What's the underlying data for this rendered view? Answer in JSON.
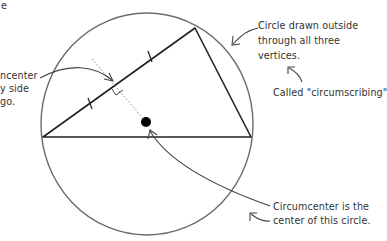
{
  "diagram": {
    "colors": {
      "background": "#ffffff",
      "circle_stroke": "#6b6b6b",
      "triangle_stroke": "#222222",
      "bisector_stroke": "#8a8a8a",
      "annotation_text": "#333333",
      "annotation_arrow": "#444444",
      "dot": "#000000"
    },
    "circle": {
      "cx": 147,
      "cy": 124,
      "rx": 106,
      "ry": 111
    },
    "triangle": {
      "vertices": [
        {
          "name": "left",
          "x": 43,
          "y": 137
        },
        {
          "name": "top",
          "x": 195,
          "y": 28
        },
        {
          "name": "right",
          "x": 251,
          "y": 137
        }
      ]
    },
    "circumcenter": {
      "x": 146,
      "y": 122,
      "r": 5
    },
    "perpendicular_bisector": {
      "from": {
        "x": 92,
        "y": 60
      },
      "to": {
        "x": 146,
        "y": 122
      }
    }
  },
  "annotations": {
    "top_left_fragment": "e",
    "left_note": [
      "ncenter",
      "y side",
      "go."
    ],
    "top_right_note": [
      "Circle drawn outside",
      "through all three",
      "vertices."
    ],
    "called_note": "Called \"circumscribing\"",
    "bottom_right_note": [
      "Circumcenter is the",
      "center of this circle."
    ]
  }
}
